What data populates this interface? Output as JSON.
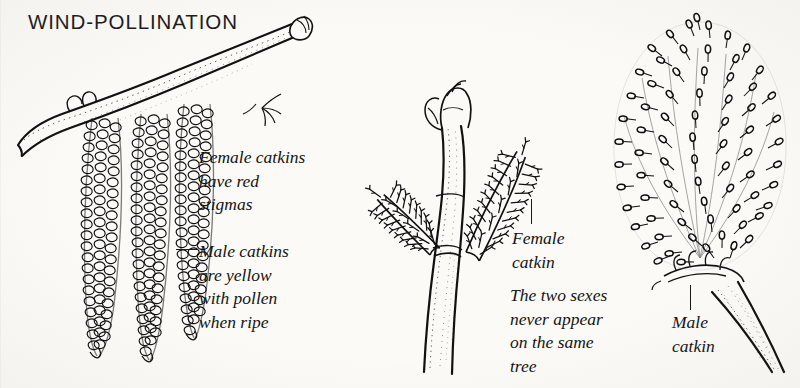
{
  "page": {
    "title": "WIND-POLLINATION",
    "background_color": "#fbfaf7",
    "ink_color": "#141414",
    "width": 800,
    "height": 388
  },
  "captions": {
    "female_catkins_left": "Female catkins\nhave red\nstigmas",
    "male_catkins_left": "Male catkins\nare yellow\nwith pollen\nwhen ripe",
    "female_catkin_middle": "Female\ncatkin",
    "two_sexes_note": "The two sexes\nnever appear\non the same\ntree",
    "male_catkin_right": "Male\ncatkin"
  },
  "figures": [
    {
      "id": "figure-hanging-catkins",
      "name": "hanging-male-catkins",
      "description": "Horizontal twig with terminal bud bearing three long pendulous knobbly catkins",
      "catkin_count": 3
    },
    {
      "id": "figure-female-spray",
      "name": "female-catkin-spray",
      "description": "Upright stalk with terminal bud bearing two bristly female catkins with protruding stigmas",
      "catkin_count": 2
    },
    {
      "id": "figure-male-catkin",
      "name": "dense-male-catkin",
      "description": "Single dense ovoid male catkin packed with looped anthers on a stout stalk",
      "catkin_count": 1
    }
  ],
  "leaders": [
    {
      "name": "leader-male-catkins-left",
      "orientation": "horizontal"
    },
    {
      "name": "leader-female-catkin-middle",
      "orientation": "vertical"
    },
    {
      "name": "leader-male-catkin-right",
      "orientation": "vertical"
    }
  ]
}
